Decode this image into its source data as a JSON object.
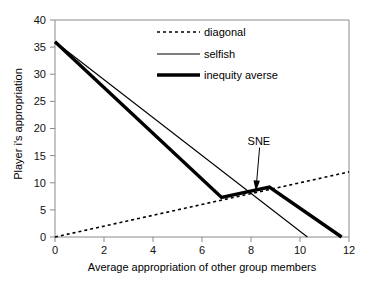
{
  "chart_data": {
    "type": "line",
    "title": "",
    "xlabel": "Average appropriation of other group members",
    "ylabel": "Player i's appropriation",
    "xlim": [
      0,
      12
    ],
    "ylim": [
      0,
      40
    ],
    "xticks": [
      "0",
      "2",
      "4",
      "6",
      "8",
      "10",
      "12"
    ],
    "yticks": [
      "0",
      "5",
      "10",
      "15",
      "20",
      "25",
      "30",
      "35",
      "40"
    ],
    "grid": false,
    "legend_position": "top-right",
    "series": [
      {
        "name": "diagonal",
        "style": "dotted",
        "color": "#000000",
        "points": [
          [
            0,
            0
          ],
          [
            12,
            12
          ]
        ]
      },
      {
        "name": "selfish",
        "style": "solid-thin",
        "color": "#000000",
        "points": [
          [
            0,
            36
          ],
          [
            10.3,
            0
          ]
        ]
      },
      {
        "name": "inequity averse",
        "style": "solid-thick",
        "color": "#000000",
        "points": [
          [
            0,
            36
          ],
          [
            6.8,
            7.3
          ],
          [
            8.75,
            9.2
          ],
          [
            11.7,
            0
          ]
        ]
      }
    ],
    "annotations": [
      {
        "text": "SNE",
        "label_x": 8.35,
        "label_y": 17.6,
        "target_x": 8.2,
        "target_y": 8.4
      }
    ]
  },
  "legend": {
    "items": [
      {
        "label": "diagonal",
        "style": "dotted"
      },
      {
        "label": "selfish",
        "style": "solid-thin"
      },
      {
        "label": "inequity averse",
        "style": "solid-thick"
      }
    ]
  },
  "axes": {
    "x_title": "Average appropriation of other group members",
    "y_title": "Player i's appropriation",
    "x_tick_labels": [
      "0",
      "2",
      "4",
      "6",
      "8",
      "10",
      "12"
    ],
    "y_tick_labels": [
      "0",
      "5",
      "10",
      "15",
      "20",
      "25",
      "30",
      "35",
      "40"
    ]
  },
  "annotation": {
    "sne_label": "SNE"
  },
  "colors": {
    "line": "#000000",
    "axis": "#808080",
    "background": "#ffffff"
  }
}
